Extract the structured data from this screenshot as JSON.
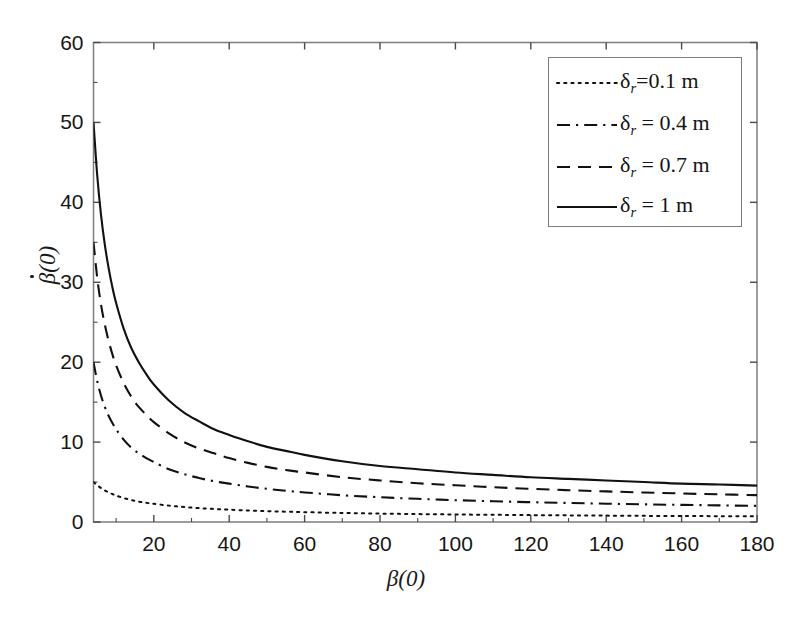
{
  "chart_data": {
    "type": "line",
    "title": "",
    "xlabel": "β(0)",
    "ylabel": "β̇(0)",
    "xlim": [
      4,
      180
    ],
    "ylim": [
      0,
      60
    ],
    "xticks": [
      20,
      40,
      60,
      80,
      100,
      120,
      140,
      160,
      180
    ],
    "yticks": [
      0,
      10,
      20,
      30,
      40,
      50,
      60
    ],
    "grid": false,
    "legend_position": "upper right",
    "x": [
      4,
      5,
      6,
      7,
      8,
      9,
      10,
      12,
      14,
      16,
      18,
      20,
      24,
      28,
      32,
      36,
      40,
      45,
      50,
      55,
      60,
      70,
      80,
      90,
      100,
      110,
      120,
      130,
      140,
      150,
      160,
      170,
      180
    ],
    "series": [
      {
        "name": "δ_r=0.1 m",
        "label": "δ",
        "sub": "r",
        "suffix": "=0.1 m",
        "delta_r": 0.1,
        "linestyle": "dotted",
        "color": "#111111",
        "values": [
          5.0,
          4.6,
          4.25,
          3.95,
          3.7,
          3.5,
          3.3,
          3.0,
          2.75,
          2.55,
          2.4,
          2.28,
          2.05,
          1.88,
          1.74,
          1.63,
          1.54,
          1.44,
          1.36,
          1.29,
          1.23,
          1.13,
          1.05,
          0.99,
          0.94,
          0.9,
          0.86,
          0.83,
          0.8,
          0.77,
          0.75,
          0.73,
          0.71
        ]
      },
      {
        "name": "δ_r = 0.4 m",
        "label": "δ",
        "sub": "r",
        "suffix": " = 0.4 m",
        "delta_r": 0.4,
        "linestyle": "dashdot",
        "color": "#111111",
        "values": [
          20.0,
          17.6,
          15.8,
          14.4,
          13.3,
          12.4,
          11.6,
          10.3,
          9.3,
          8.6,
          8.0,
          7.5,
          6.6,
          6.0,
          5.5,
          5.1,
          4.8,
          4.45,
          4.15,
          3.9,
          3.7,
          3.35,
          3.1,
          2.9,
          2.73,
          2.6,
          2.48,
          2.38,
          2.29,
          2.21,
          2.14,
          2.08,
          2.02
        ]
      },
      {
        "name": "δ_r = 0.7 m",
        "label": "δ",
        "sub": "r",
        "suffix": " = 0.7 m",
        "delta_r": 0.7,
        "linestyle": "dashed",
        "color": "#111111",
        "values": [
          35.0,
          30.5,
          27.2,
          24.7,
          22.7,
          21.0,
          19.6,
          17.4,
          15.7,
          14.4,
          13.4,
          12.5,
          11.1,
          10.0,
          9.2,
          8.6,
          8.0,
          7.4,
          6.9,
          6.5,
          6.2,
          5.6,
          5.2,
          4.85,
          4.6,
          4.35,
          4.15,
          3.98,
          3.83,
          3.69,
          3.57,
          3.46,
          3.36
        ]
      },
      {
        "name": "δ_r = 1 m",
        "label": "δ",
        "sub": "r",
        "suffix": " = 1 m",
        "delta_r": 1.0,
        "linestyle": "solid",
        "color": "#111111",
        "values": [
          50.0,
          43.3,
          38.4,
          34.7,
          31.8,
          29.4,
          27.4,
          24.2,
          21.8,
          20.0,
          18.5,
          17.2,
          15.2,
          13.7,
          12.6,
          11.6,
          10.9,
          10.1,
          9.4,
          8.9,
          8.4,
          7.6,
          7.0,
          6.6,
          6.2,
          5.9,
          5.6,
          5.4,
          5.2,
          5.0,
          4.8,
          4.7,
          4.55
        ]
      }
    ]
  },
  "axes": {
    "xlabel": "β(0)",
    "ylabel_base": "β",
    "ylabel_suffix": "(0)",
    "xticks": [
      "20",
      "40",
      "60",
      "80",
      "100",
      "120",
      "140",
      "160",
      "180"
    ],
    "yticks": [
      "0",
      "10",
      "20",
      "30",
      "40",
      "50",
      "60"
    ],
    "frame_color": "#7d7d7d",
    "tick_color": "#4a4a4a"
  },
  "legend": {
    "entries": [
      {
        "sym": "δ",
        "sub": "r",
        "rest": "=0.1 m"
      },
      {
        "sym": "δ",
        "sub": "r",
        "rest": " = 0.4 m"
      },
      {
        "sym": "δ",
        "sub": "r",
        "rest": " = 0.7 m"
      },
      {
        "sym": "δ",
        "sub": "r",
        "rest": " = 1 m"
      }
    ]
  }
}
